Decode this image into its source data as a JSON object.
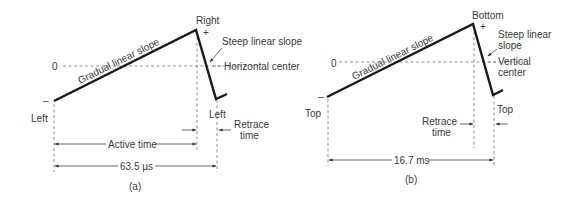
{
  "panel_a": {
    "caption": "(a)",
    "zero_label": "0",
    "plus_label": "+",
    "minus_label": "–",
    "peak_label": "Right",
    "slope_label": "Gradual linear slope",
    "steep_label": "Steep linear slope",
    "center_label": "Horizontal center",
    "start_label": "Left",
    "end_label": "Left",
    "retrace_label_line1": "Retrace",
    "retrace_label_line2": "time",
    "active_label": "Active time",
    "period_label": "63.5 µs"
  },
  "panel_b": {
    "caption": "(b)",
    "zero_label": "0",
    "plus_label": "+",
    "minus_label": "–",
    "peak_label": "Bottom",
    "slope_label": "Gradual linear slope",
    "steep_label_line1": "Steep linear",
    "steep_label_line2": "slope",
    "center_label_line1": "Vertical",
    "center_label_line2": "center",
    "start_label": "Top",
    "end_label": "Top",
    "retrace_label_line1": "Retrace",
    "retrace_label_line2": "time",
    "period_label": "16.7 ms"
  },
  "colors": {
    "waveform": "#1a1a1a",
    "text": "#3a3a3a",
    "dashed": "#777777"
  }
}
